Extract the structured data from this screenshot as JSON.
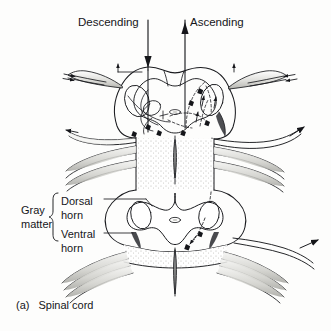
{
  "figure": {
    "caption_marker": "(a)",
    "caption_text": "Spinal cord"
  },
  "labels": {
    "descending": "Descending",
    "ascending": "Ascending",
    "gray_matter_line1": "Gray",
    "gray_matter_line2": "matter",
    "dorsal_horn_line1": "Dorsal",
    "dorsal_horn_line2": "horn",
    "ventral_horn_line1": "Ventral",
    "ventral_horn_line2": "horn"
  },
  "colors": {
    "ink": "#15161a",
    "line": "#1a1b1f",
    "background": "#fdfdfc",
    "white_matter_fill": "#ffffff",
    "stipple": "#b9b9b4",
    "root_shade": "#d8d8d4",
    "horn_tip": "#2a2b2f"
  },
  "icons": {
    "descending_arrow": "arrow-down-icon",
    "ascending_arrow": "arrow-up-icon",
    "gray_matter_brace": "curly-brace-icon"
  }
}
